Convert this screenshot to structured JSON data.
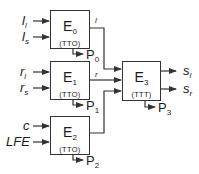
{
  "diagram": {
    "blocks": [
      {
        "id": "E0",
        "name": "E",
        "sub": "0",
        "mode": "(TTO)",
        "inputs": [
          {
            "base": "l",
            "sub": "l"
          },
          {
            "base": "l",
            "sub": "s"
          }
        ],
        "output_wire": "l",
        "p_label": "P",
        "p_sub": "0"
      },
      {
        "id": "E1",
        "name": "E",
        "sub": "1",
        "mode": "(TTO)",
        "inputs": [
          {
            "base": "r",
            "sub": "l"
          },
          {
            "base": "r",
            "sub": "s"
          }
        ],
        "output_wire": "r",
        "p_label": "P",
        "p_sub": "1"
      },
      {
        "id": "E2",
        "name": "E",
        "sub": "2",
        "mode": "(TTO)",
        "inputs": [
          {
            "base": "c",
            "sub": ""
          },
          {
            "base": "LFE",
            "sub": ""
          }
        ],
        "output_wire": "",
        "p_label": "P",
        "p_sub": "2"
      },
      {
        "id": "E3",
        "name": "E",
        "sub": "3",
        "mode": "(TTT)",
        "outputs": [
          {
            "base": "s",
            "sub": "l"
          },
          {
            "base": "s",
            "sub": "r"
          }
        ],
        "p_label": "P",
        "p_sub": "3"
      }
    ],
    "colors": {
      "line": "#333333",
      "text": "#1a1a1a",
      "background": "#ffffff"
    }
  }
}
